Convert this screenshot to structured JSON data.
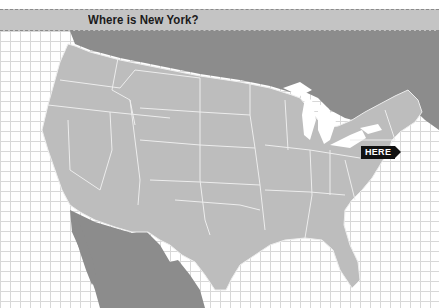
{
  "header": {
    "title": "Where is New York?"
  },
  "map": {
    "marker_label": "HERE",
    "marker_target": "New York",
    "colors": {
      "us_land": "#bdbdbd",
      "foreign_land": "#8c8c8c",
      "borders": "#ededed",
      "water": "#ffffff",
      "grid": "#d8d8d8",
      "marker_bg": "#111111",
      "marker_text": "#ffffff"
    }
  }
}
